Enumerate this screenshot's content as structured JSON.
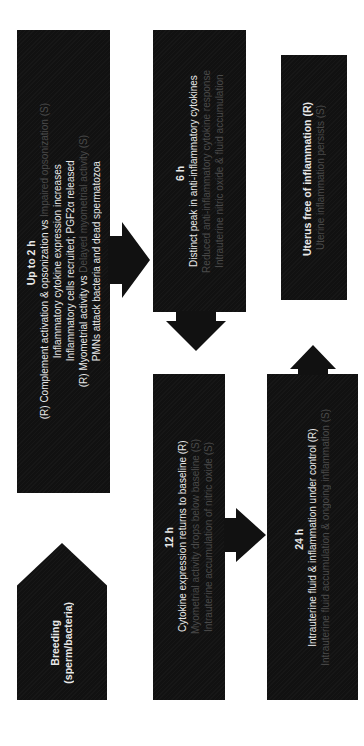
{
  "diagram": {
    "orientation": "rotated 90° counter-clockwise",
    "colors": {
      "box": "#111111",
      "text": "#e8e8e8",
      "dim_text": "#4a4a4a",
      "background": "#ffffff"
    },
    "nodes": {
      "breeding": {
        "line1": "Breeding",
        "line2": "(sperm/bacteria)"
      },
      "up_to_2h": {
        "title": "Up to 2 h",
        "line1_main": "(R) Complement activation & opsonization vs ",
        "line1_dim": "Impaired opsonization (S)",
        "line2": "Inflammatory cytokine expression increases",
        "line3": "Inflammatory cells recruited; PGF2α released",
        "line4_main": "(R) Myometrial activity vs ",
        "line4_dim": "Delayed myometrial activity (S)",
        "line5": "PMNs attack bacteria and dead spermatozoa"
      },
      "h6": {
        "title": "6 h",
        "line1": "Distinct peak in anti-inflammatory cytokines",
        "line2_dim": "Reduced anti-inflammatory cytokine response",
        "line3_dim": "Intrauterine nitric oxide & fluid accumulation"
      },
      "uterus": {
        "line1": "Uterus free of inflammation (R)",
        "line2_dim": "Uterine inflammation persists (S)"
      },
      "h12": {
        "title": "12 h",
        "line1": "Cytokine expression returns to baseline (R)",
        "line2_dim": "Myometrial activity drops below baseline (S)",
        "line3_dim": "Intrauterine accumulation of nitric oxide (S)"
      },
      "h24": {
        "title": "24 h",
        "line1": "Intrauterine fluid & inflammation under control (R)",
        "line2_dim": "Intrauterine fluid accumulation & ongoing inflammation (S)"
      }
    },
    "edges": [
      {
        "from": "breeding",
        "to": "up_to_2h"
      },
      {
        "from": "up_to_2h",
        "to": "h6"
      },
      {
        "from": "h6",
        "to": "h12"
      },
      {
        "from": "h12",
        "to": "h24"
      },
      {
        "from": "h24",
        "to": "uterus"
      }
    ]
  }
}
